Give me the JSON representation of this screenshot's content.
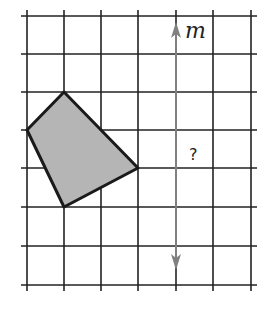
{
  "diagram": {
    "type": "reflection-grid",
    "grid": {
      "x_lines": [
        27,
        64,
        101,
        138,
        176,
        213,
        251
      ],
      "y_lines": [
        16,
        54,
        92,
        130,
        168,
        207,
        246,
        285
      ],
      "line_color": "#222222"
    },
    "shape": {
      "vertices": [
        [
          64,
          92
        ],
        [
          27,
          130
        ],
        [
          64,
          207
        ],
        [
          138,
          168
        ]
      ],
      "fill": "#b5b5b5",
      "stroke": "#1a1a1a"
    },
    "mirror_line": {
      "label": "m",
      "x": 176,
      "y_top": 22,
      "y_bottom": 270,
      "color": "#808080"
    },
    "question_mark": "?"
  }
}
